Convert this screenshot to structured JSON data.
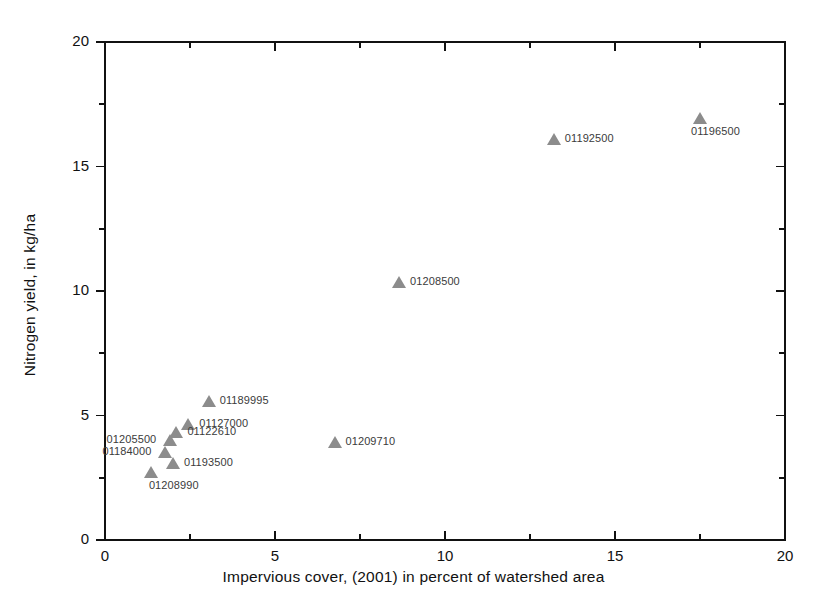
{
  "chart_data": {
    "type": "scatter",
    "title": "",
    "xlabel": "Impervious cover, (2001) in percent of watershed area",
    "ylabel": "Nitrogen yield, in kg/ha",
    "xlim": [
      0,
      20
    ],
    "ylim": [
      0,
      20
    ],
    "xticks": [
      0,
      5,
      10,
      15,
      20
    ],
    "yticks": [
      0,
      5,
      10,
      15,
      20
    ],
    "xticklabels": [
      "0",
      "5",
      "10",
      "15",
      "20"
    ],
    "yticklabels": [
      "0",
      "5",
      "10",
      "15",
      "20"
    ],
    "xminor_step": 2.5,
    "yminor_step": 2.5,
    "grid": false,
    "legend": false,
    "marker_shape": "triangle-up",
    "marker_color": "#8c8c8c",
    "axis_color": "#111111",
    "points": [
      {
        "label": "01208990",
        "x": 1.35,
        "y": 2.75,
        "label_pos": "below"
      },
      {
        "label": "01184000",
        "x": 1.75,
        "y": 3.55,
        "label_pos": "left"
      },
      {
        "label": "01205500",
        "x": 1.9,
        "y": 4.0,
        "label_pos": "left"
      },
      {
        "label": "01193500",
        "x": 2.0,
        "y": 3.1,
        "label_pos": "right"
      },
      {
        "label": "01122610",
        "x": 2.1,
        "y": 4.35,
        "label_pos": "right"
      },
      {
        "label": "01127000",
        "x": 2.45,
        "y": 4.65,
        "label_pos": "right"
      },
      {
        "label": "01189995",
        "x": 3.05,
        "y": 5.6,
        "label_pos": "right"
      },
      {
        "label": "01209710",
        "x": 6.75,
        "y": 3.95,
        "label_pos": "right"
      },
      {
        "label": "01208500",
        "x": 8.65,
        "y": 10.35,
        "label_pos": "right"
      },
      {
        "label": "01192500",
        "x": 13.2,
        "y": 16.1,
        "label_pos": "right"
      },
      {
        "label": "01196500",
        "x": 17.5,
        "y": 16.95,
        "label_pos": "below-right"
      }
    ]
  },
  "plot_frame": {
    "left": 105,
    "right": 785,
    "top": 42,
    "bottom": 540
  }
}
